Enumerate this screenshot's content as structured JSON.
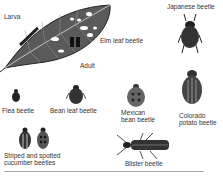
{
  "figure": {
    "labels": {
      "larva": "Larva",
      "adult": "Adult",
      "elm_leaf_beetle": "Elm leaf beetle",
      "japanese_beetle": "Japanese beetle",
      "flea_beetle": "Flea beetle",
      "bean_leaf_beetle": "Bean leaf beetle",
      "mexican_bean_beetle_1": "Mexican",
      "mexican_bean_beetle_2": "bean beetle",
      "colorado_potato_beetle_1": "Colorado",
      "colorado_potato_beetle_2": "potato beetle",
      "striped_spotted_1": "Striped and spotted",
      "striped_spotted_2": "cucumber beetles",
      "blister_beetle": "Blister beetle"
    },
    "colors": {
      "ink": "#222222",
      "leaf": "#555555",
      "background": "#ffffff"
    }
  }
}
